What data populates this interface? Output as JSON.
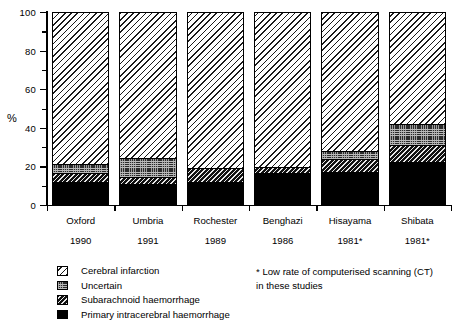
{
  "chart_data": {
    "type": "bar",
    "subtype": "stacked-bar-100",
    "title": "",
    "xlabel": "",
    "ylabel": "%",
    "ylim": [
      0,
      100
    ],
    "yticks": [
      0,
      20,
      40,
      60,
      80,
      100
    ],
    "ytick_labels": [
      "0",
      "20",
      "40",
      "60",
      "80",
      "100"
    ],
    "yminor_ticks": [
      10,
      30,
      50,
      70,
      90
    ],
    "grid": false,
    "legend_position": "bottom-left",
    "categories": [
      "Oxford",
      "Umbria",
      "Rochester",
      "Benghazi",
      "Hisayama",
      "Shibata"
    ],
    "category_years": [
      "1990",
      "1991",
      "1989",
      "1986",
      "1981*",
      "1981*"
    ],
    "series": [
      {
        "name": "Primary intracerebral haemorrhage",
        "pattern": "solid-black",
        "values": [
          11.5,
          10.5,
          11.5,
          16.0,
          16.5,
          22.0
        ]
      },
      {
        "name": "Subarachnoid haemorrhage",
        "pattern": "dense-diagonal-hatch",
        "values": [
          4.5,
          3.5,
          7.0,
          3.0,
          7.0,
          8.5
        ]
      },
      {
        "name": "Uncertain",
        "pattern": "checker-grey",
        "values": [
          4.5,
          10.0,
          0.0,
          0.0,
          4.0,
          11.0
        ]
      },
      {
        "name": "Cerebral infarction",
        "pattern": "sparse-diagonal-hatch",
        "values": [
          79.5,
          76.0,
          81.5,
          81.0,
          72.5,
          58.5
        ]
      }
    ],
    "cumulative_tops": {
      "Oxford": [
        11.5,
        16.0,
        20.5,
        100
      ],
      "Umbria": [
        10.5,
        14.0,
        24.0,
        100
      ],
      "Rochester": [
        11.5,
        18.5,
        18.5,
        100
      ],
      "Benghazi": [
        16.0,
        19.0,
        19.0,
        100
      ],
      "Hisayama": [
        16.5,
        23.5,
        27.5,
        100
      ],
      "Shibata": [
        22.0,
        30.5,
        41.5,
        100
      ]
    },
    "annotations": [
      "* Low rate of computerised scanning (CT) in these studies"
    ]
  },
  "legend": {
    "items": [
      {
        "label": "Cerebral infarction",
        "pattern": "sparse-diagonal-hatch"
      },
      {
        "label": "Uncertain",
        "pattern": "checker-grey"
      },
      {
        "label": "Subarachnoid haemorrhage",
        "pattern": "dense-diagonal-hatch"
      },
      {
        "label": "Primary intracerebral haemorrhage",
        "pattern": "solid-black"
      }
    ]
  },
  "footnote": {
    "text": "* Low rate of computerised scanning (CT)\nin these studies"
  },
  "colors": {
    "ink": "#000000",
    "paper": "#ffffff",
    "uncertain_fill": "#2b2b2b",
    "subarachnoid_fill": "#111111"
  }
}
